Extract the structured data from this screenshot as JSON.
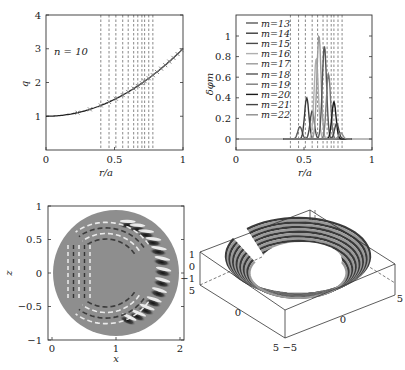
{
  "chart_data": [
    {
      "id": "q-profile",
      "type": "line",
      "title": "",
      "annotation": "n = 10",
      "xlabel": "r/a",
      "ylabel": "q",
      "xlim": [
        0,
        1
      ],
      "ylim": [
        0,
        4
      ],
      "xticks": [
        "0",
        "0.5",
        "1"
      ],
      "yticks": [
        "1",
        "2",
        "3",
        "4"
      ],
      "grid": false,
      "x": [
        0,
        0.1,
        0.2,
        0.3,
        0.4,
        0.5,
        0.6,
        0.7,
        0.8,
        0.9,
        1.0
      ],
      "values": [
        1.0,
        1.02,
        1.08,
        1.18,
        1.32,
        1.5,
        1.72,
        1.98,
        2.28,
        2.62,
        3.0
      ],
      "rational_surfaces_x": [
        0.4,
        0.46,
        0.51,
        0.56,
        0.6,
        0.64,
        0.67,
        0.7,
        0.72,
        0.75,
        0.78
      ],
      "markers": "x",
      "marker_x": [
        0.23,
        0.32,
        0.4,
        0.46,
        0.51,
        0.56,
        0.6,
        0.64,
        0.67,
        0.7,
        0.72,
        0.75,
        0.78,
        0.81,
        0.84,
        0.87,
        0.9,
        0.93,
        0.96,
        0.99
      ]
    },
    {
      "id": "mode-structure",
      "type": "line",
      "title": "",
      "xlabel": "r/a",
      "ylabel": "δφ_m",
      "xlim": [
        0,
        1
      ],
      "ylim": [
        -0.1,
        1.2
      ],
      "xticks": [
        "0",
        "0.5",
        "1"
      ],
      "yticks": [
        "0",
        "0.2",
        "0.4",
        "0.6",
        "0.8",
        "1"
      ],
      "legend_position": "upper left",
      "series": [
        {
          "name": "m=13",
          "peak_x": 0.47,
          "peak": 0.12,
          "color": "#5a5a5a"
        },
        {
          "name": "m=14",
          "peak_x": 0.52,
          "peak": 0.4,
          "color": "#3a3a3a"
        },
        {
          "name": "m=15",
          "peak_x": 0.56,
          "peak": 0.27,
          "color": "#4a4a4a"
        },
        {
          "name": "m=16",
          "peak_x": 0.59,
          "peak": 0.78,
          "color": "#b0b0b0"
        },
        {
          "name": "m=17",
          "peak_x": 0.61,
          "peak": 1.0,
          "color": "#9a9a9a"
        },
        {
          "name": "m=18",
          "peak_x": 0.65,
          "peak": 0.9,
          "color": "#555555"
        },
        {
          "name": "m=19",
          "peak_x": 0.68,
          "peak": 0.63,
          "color": "#7a7a7a"
        },
        {
          "name": "m=20",
          "peak_x": 0.72,
          "peak": 0.36,
          "color": "#1a1a1a"
        },
        {
          "name": "m=21",
          "peak_x": 0.74,
          "peak": 0.15,
          "color": "#444444"
        },
        {
          "name": "m=22",
          "peak_x": 0.77,
          "peak": 0.06,
          "color": "#8c8c8c"
        }
      ],
      "rational_surfaces_x": [
        0.4,
        0.46,
        0.51,
        0.56,
        0.6,
        0.64,
        0.67,
        0.7,
        0.72,
        0.75,
        0.78
      ]
    },
    {
      "id": "poloidal-cross-section",
      "type": "heatmap",
      "title": "",
      "xlabel": "x",
      "ylabel": "z",
      "xlim": [
        0,
        2
      ],
      "ylim": [
        -1,
        1
      ],
      "xticks": [
        "0",
        "1",
        "2"
      ],
      "yticks": [
        "−1",
        "−0.5",
        "0",
        "0.5",
        "1"
      ],
      "description": "Grayscale mode structure on circular cross-section, ballooning on outboard side"
    },
    {
      "id": "torus-3d",
      "type": "surface3d",
      "title": "",
      "zticks": [
        "1",
        "0",
        "−1"
      ],
      "xticks": [
        "5",
        "0",
        "−5"
      ],
      "yticks": [
        "−5",
        "0",
        "5"
      ],
      "description": "3D cut-open torus of mode field lines"
    }
  ],
  "labels": {
    "p1_annot": "n = 10",
    "p1_xlabel": "r/a",
    "p1_ylabel": "q",
    "p2_xlabel": "r/a",
    "p2_ylabel": "δφm",
    "p3_xlabel": "x",
    "p3_ylabel": "z"
  }
}
